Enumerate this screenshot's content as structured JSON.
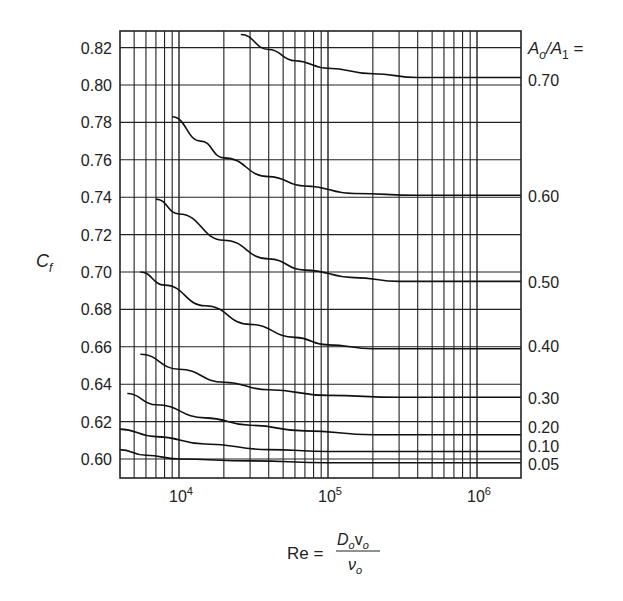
{
  "chart_data": {
    "type": "line",
    "title": "",
    "xlabel": "Re = D_o v_o / ν_o",
    "ylabel": "C_f",
    "xscale": "log",
    "xlim": [
      4000,
      2000000
    ],
    "ylim": [
      0.592,
      0.829
    ],
    "grid": true,
    "x_ticks": [
      "10^4",
      "10^5",
      "10^6"
    ],
    "y_ticks": [
      "0.60",
      "0.62",
      "0.64",
      "0.66",
      "0.68",
      "0.70",
      "0.72",
      "0.74",
      "0.76",
      "0.78",
      "0.80",
      "0.82"
    ],
    "legend_title": "A_o/A_1 =",
    "legend_position": "right",
    "series": [
      {
        "name": "0.70",
        "points": [
          [
            26000,
            0.827
          ],
          [
            40000,
            0.819
          ],
          [
            60000,
            0.813
          ],
          [
            100000,
            0.809
          ],
          [
            200000,
            0.806
          ],
          [
            400000,
            0.804
          ],
          [
            2000000,
            0.804
          ]
        ]
      },
      {
        "name": "0.60",
        "points": [
          [
            9000,
            0.783
          ],
          [
            14000,
            0.77
          ],
          [
            20000,
            0.761
          ],
          [
            40000,
            0.751
          ],
          [
            70000,
            0.746
          ],
          [
            150000,
            0.742
          ],
          [
            400000,
            0.741
          ],
          [
            2000000,
            0.741
          ]
        ]
      },
      {
        "name": "0.50",
        "points": [
          [
            7000,
            0.739
          ],
          [
            10000,
            0.731
          ],
          [
            20000,
            0.717
          ],
          [
            40000,
            0.707
          ],
          [
            70000,
            0.701
          ],
          [
            150000,
            0.697
          ],
          [
            300000,
            0.695
          ],
          [
            2000000,
            0.695
          ]
        ]
      },
      {
        "name": "0.40",
        "points": [
          [
            5500,
            0.7
          ],
          [
            8000,
            0.693
          ],
          [
            15000,
            0.682
          ],
          [
            30000,
            0.672
          ],
          [
            60000,
            0.665
          ],
          [
            100000,
            0.661
          ],
          [
            200000,
            0.659
          ],
          [
            2000000,
            0.659
          ]
        ]
      },
      {
        "name": "0.30",
        "points": [
          [
            5500,
            0.656
          ],
          [
            10000,
            0.648
          ],
          [
            20000,
            0.641
          ],
          [
            40000,
            0.637
          ],
          [
            100000,
            0.634
          ],
          [
            300000,
            0.633
          ],
          [
            2000000,
            0.633
          ]
        ]
      },
      {
        "name": "0.20",
        "points": [
          [
            4500,
            0.635
          ],
          [
            7000,
            0.629
          ],
          [
            15000,
            0.622
          ],
          [
            30000,
            0.618
          ],
          [
            70000,
            0.615
          ],
          [
            200000,
            0.613
          ],
          [
            2000000,
            0.613
          ]
        ]
      },
      {
        "name": "0.10",
        "points": [
          [
            4000,
            0.616
          ],
          [
            7000,
            0.612
          ],
          [
            15000,
            0.608
          ],
          [
            40000,
            0.605
          ],
          [
            100000,
            0.604
          ],
          [
            2000000,
            0.604
          ]
        ]
      },
      {
        "name": "0.05",
        "points": [
          [
            4000,
            0.605
          ],
          [
            6000,
            0.602
          ],
          [
            10000,
            0.6
          ],
          [
            30000,
            0.599
          ],
          [
            100000,
            0.598
          ],
          [
            2000000,
            0.598
          ]
        ]
      }
    ]
  },
  "labels": {
    "ylabel_main": "C",
    "ylabel_sub": "f",
    "legend_A": "A",
    "legend_o": "o",
    "legend_slash": "/",
    "legend_A1": "A",
    "legend_1": "1",
    "legend_eq": " =",
    "xlabel_re": "Re =",
    "x_num_D": "D",
    "x_num_o1": "o",
    "x_num_v": "v",
    "x_num_o2": "o",
    "x_den_nu": "ν",
    "x_den_o": "o",
    "x_tick_base": "10",
    "x_tick_exps": [
      "4",
      "5",
      "6"
    ]
  }
}
